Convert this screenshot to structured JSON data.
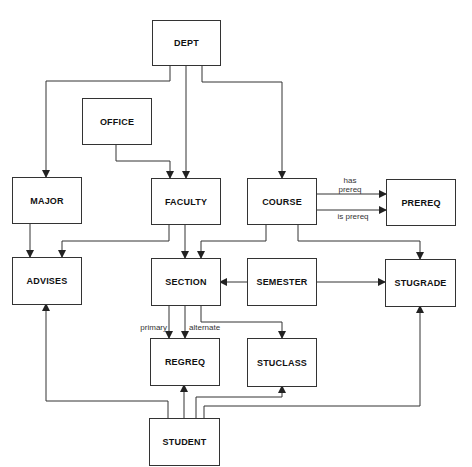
{
  "diagram": {
    "entities": {
      "dept": "DEPT",
      "office": "OFFICE",
      "major": "MAJOR",
      "faculty": "FACULTY",
      "course": "COURSE",
      "prereq": "PREREQ",
      "advises": "ADVISES",
      "section": "SECTION",
      "semester": "SEMESTER",
      "stugrade": "STUGRADE",
      "regreq": "REGREQ",
      "stuclass": "STUCLASS",
      "student": "STUDENT"
    },
    "edge_labels": {
      "has_prereq_1": "has",
      "has_prereq_2": "prereq",
      "is_prereq": "is prereq",
      "primary": "primary",
      "alternate": "alternate"
    },
    "relationships": [
      {
        "from": "DEPT",
        "to": "MAJOR"
      },
      {
        "from": "DEPT",
        "to": "FACULTY"
      },
      {
        "from": "DEPT",
        "to": "COURSE"
      },
      {
        "from": "OFFICE",
        "to": "FACULTY"
      },
      {
        "from": "MAJOR",
        "to": "ADVISES"
      },
      {
        "from": "FACULTY",
        "to": "ADVISES"
      },
      {
        "from": "FACULTY",
        "to": "SECTION"
      },
      {
        "from": "COURSE",
        "to": "PREREQ",
        "label": "has prereq"
      },
      {
        "from": "COURSE",
        "to": "PREREQ",
        "label": "is prereq"
      },
      {
        "from": "COURSE",
        "to": "SECTION"
      },
      {
        "from": "COURSE",
        "to": "STUGRADE"
      },
      {
        "from": "SEMESTER",
        "to": "SECTION"
      },
      {
        "from": "SEMESTER",
        "to": "STUGRADE"
      },
      {
        "from": "SECTION",
        "to": "REGREQ",
        "label": "primary"
      },
      {
        "from": "SECTION",
        "to": "REGREQ",
        "label": "alternate"
      },
      {
        "from": "SECTION",
        "to": "STUCLASS"
      },
      {
        "from": "STUDENT",
        "to": "ADVISES"
      },
      {
        "from": "STUDENT",
        "to": "REGREQ"
      },
      {
        "from": "STUDENT",
        "to": "STUCLASS"
      },
      {
        "from": "STUDENT",
        "to": "STUGRADE"
      }
    ],
    "colors": {
      "line": "#333333",
      "background": "#ffffff"
    }
  }
}
